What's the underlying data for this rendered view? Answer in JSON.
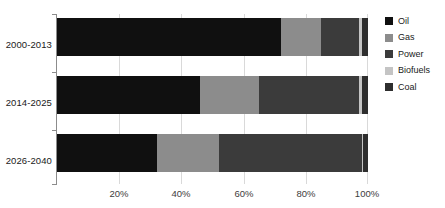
{
  "chart_data": {
    "type": "bar",
    "orientation": "horizontal",
    "stacked": true,
    "normalized_percent": true,
    "title": "",
    "subtitle": "",
    "xlabel": "",
    "ylabel": "",
    "xlim": [
      0,
      100
    ],
    "xticks": [
      20,
      40,
      60,
      80,
      100
    ],
    "xtick_labels": [
      "20%",
      "40%",
      "60%",
      "80%",
      "100%"
    ],
    "grid": true,
    "grid_axis": "x",
    "legend_position": "right",
    "categories": [
      "2000-2013",
      "2014-2025",
      "2026-2040"
    ],
    "series": [
      {
        "name": "Oil",
        "color": "#101010",
        "values": [
          72.0,
          46.0,
          32.0
        ]
      },
      {
        "name": "Gas",
        "color": "#8c8c8c",
        "values": [
          13.0,
          19.0,
          20.0
        ]
      },
      {
        "name": "Power",
        "color": "#3b3b3b",
        "values": [
          12.0,
          32.0,
          46.0
        ]
      },
      {
        "name": "Biofuels",
        "color": "#c4c4c4",
        "values": [
          1.0,
          1.0,
          0.5
        ]
      },
      {
        "name": "Coal",
        "color": "#2e2e2e",
        "values": [
          2.0,
          2.0,
          1.5
        ]
      }
    ]
  },
  "axis": {
    "line_color": "#8c8c8c",
    "gridline_color": "#d9d9d9"
  },
  "background_color": "#ffffff"
}
